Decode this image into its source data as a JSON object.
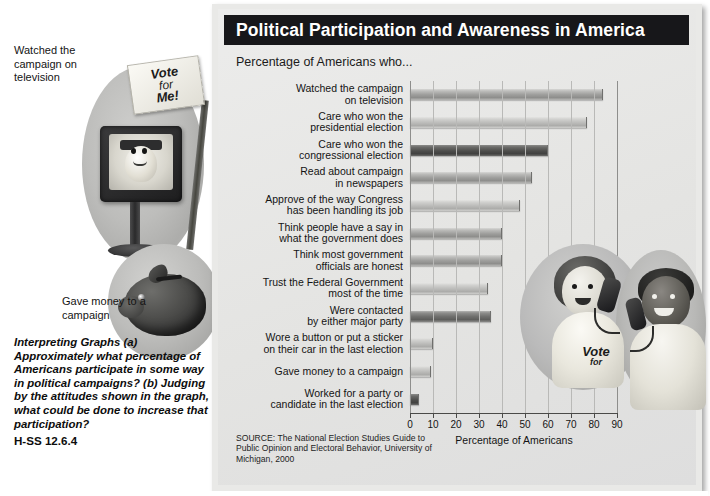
{
  "figure": {
    "title": "Political Participation and Awareness in America",
    "subtitle": "Percentage of Americans who...",
    "source": "SOURCE: The National Election Studies Guide to Public Opinion and Electoral Behavior, University of Michigan, 2000"
  },
  "annotations": {
    "television": "Watched the campaign on television",
    "money": "Gave money to a campaign",
    "contacted": "Were contacted by either major party",
    "interpreting": "Interpreting Graphs (a) Approximately what percentage of Americans participate in some way in political campaigns? (b) Judging by the attitudes shown in the graph, what could be done to increase that participation?",
    "standard": "H-SS 12.6.4"
  },
  "photo_labels": {
    "sign_line1": "Vote",
    "sign_line2": "for",
    "sign_line3": "Me!",
    "tshirt_line1": "Vote",
    "tshirt_line2": "for"
  },
  "chart_data": {
    "type": "bar",
    "orientation": "horizontal",
    "title": "Political Participation and Awareness in America",
    "subtitle": "Percentage of Americans who...",
    "xlabel": "Percentage of Americans",
    "ylabel": "",
    "xlim": [
      0,
      90
    ],
    "xticks": [
      0,
      10,
      20,
      30,
      40,
      50,
      60,
      70,
      80,
      90
    ],
    "grid": true,
    "legend": false,
    "categories": [
      "Watched the campaign on television",
      "Care who won the presidential election",
      "Care who won the congressional election",
      "Read about campaign in newspapers",
      "Approve of the way Congress has been handling its job",
      "Think people have a say in what the government does",
      "Think most government officials are honest",
      "Trust the Federal Government most of the time",
      "Were contacted by either major party",
      "Wore a button or put a sticker on their car in the last election",
      "Gave money to a campaign",
      "Worked for a party or candidate in the last election"
    ],
    "category_lines": [
      [
        "Watched the campaign",
        "on television"
      ],
      [
        "Care who won the",
        "presidential election"
      ],
      [
        "Care who won the",
        "congressional election"
      ],
      [
        "Read about campaign",
        "in newspapers"
      ],
      [
        "Approve of the way Congress",
        "has been handling its job"
      ],
      [
        "Think people have a say in",
        "what the government does"
      ],
      [
        "Think most government",
        "officials are honest"
      ],
      [
        "Trust the Federal Government",
        "most of the time"
      ],
      [
        "Were contacted",
        "by either major party"
      ],
      [
        "Wore a button or put a sticker",
        "on their car in the last election"
      ],
      [
        "Gave money to a campaign"
      ],
      [
        "Worked for a party or",
        "candidate in the last election"
      ]
    ],
    "values": [
      84,
      77,
      60,
      53,
      48,
      40,
      40,
      34,
      35,
      10,
      9,
      4
    ],
    "shades": [
      "mid",
      "light",
      "darkest",
      "mid",
      "light",
      "mid",
      "mid",
      "light",
      "dark",
      "light",
      "light",
      "darkest"
    ],
    "source": "SOURCE: The National Election Studies Guide to Public Opinion and Electoral Behavior, University of Michigan, 2000"
  }
}
